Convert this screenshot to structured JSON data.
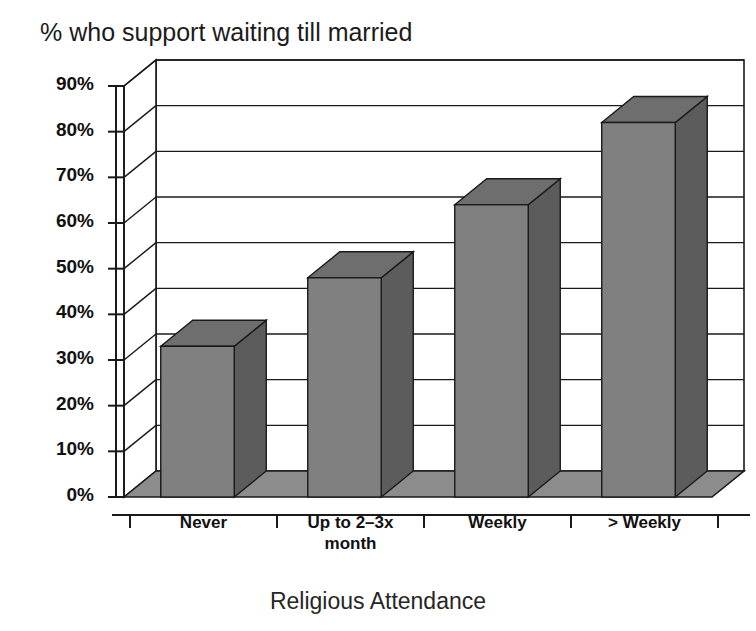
{
  "chart_data": {
    "type": "bar",
    "title": "% who support waiting till married",
    "xlabel": "Religious Attendance",
    "ylabel": "",
    "categories": [
      "Never",
      "Up to 2–3x month",
      "Weekly",
      "> Weekly"
    ],
    "values": [
      33,
      48,
      64,
      82
    ],
    "ylim": [
      0,
      90
    ],
    "ytick_labels": [
      "90%",
      "80%",
      "70%",
      "60%",
      "50%",
      "40%",
      "30%",
      "20%",
      "10%",
      "0%"
    ],
    "ytick_values": [
      90,
      80,
      70,
      60,
      50,
      40,
      30,
      20,
      10,
      0
    ],
    "grid": true,
    "legend": false,
    "style": "3d-column",
    "bar_color": "#808080",
    "bar_top_color": "#6e6e6e",
    "bar_side_color": "#5c5c5c",
    "floor_color": "#8c8c8c",
    "axis_color": "#1a1a1a"
  },
  "category_labels": [
    {
      "line1": "Never",
      "line2": ""
    },
    {
      "line1": "Up to 2–3x",
      "line2": "month"
    },
    {
      "line1": "Weekly",
      "line2": ""
    },
    {
      "line1": "> Weekly",
      "line2": ""
    }
  ]
}
